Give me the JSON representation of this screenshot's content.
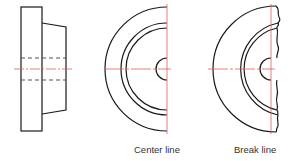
{
  "figure": {
    "views": [
      {
        "id": "side-view",
        "label": ""
      },
      {
        "id": "center-line-view",
        "label": "Center line"
      },
      {
        "id": "break-line-view",
        "label": "Break line"
      }
    ]
  },
  "colors": {
    "outline": "#1a1a1a",
    "hidden": "#555555",
    "center": "#e06060",
    "text": "#333333"
  }
}
